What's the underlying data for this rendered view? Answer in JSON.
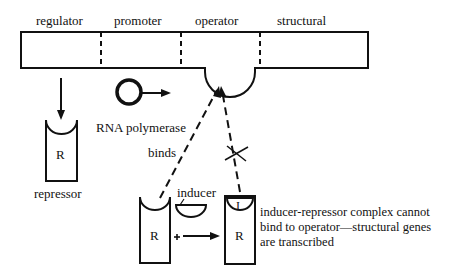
{
  "gene_segments": [
    {
      "label": "regulator"
    },
    {
      "label": "promoter"
    },
    {
      "label": "operator"
    },
    {
      "label": "structural"
    }
  ],
  "repressor": {
    "letter": "R",
    "label": "repressor"
  },
  "rna_polymerase": {
    "label": "RNA polymerase"
  },
  "binding": {
    "label": "binds"
  },
  "inducer": {
    "label": "inducer",
    "plus": "+"
  },
  "complex": {
    "repressor_letter": "R",
    "inducer_letter": "I",
    "caption_lines": [
      "inducer-repressor complex cannot",
      "bind to operator—structural genes",
      "are transcribed"
    ]
  },
  "colors": {
    "ink": "#111111",
    "background": "#ffffff"
  }
}
